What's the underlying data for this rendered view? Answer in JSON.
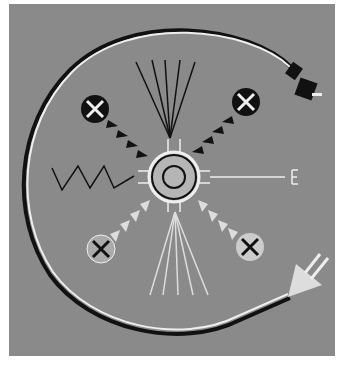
{
  "artwork": {
    "subject": "sandpainting-style circle with central sun, arrows, plants and plug",
    "colors": {
      "background": "#8a8a8a",
      "border": "#ffffff",
      "dark": "#111111",
      "light": "#e8e8e8",
      "center": "#b5b5b5"
    }
  }
}
